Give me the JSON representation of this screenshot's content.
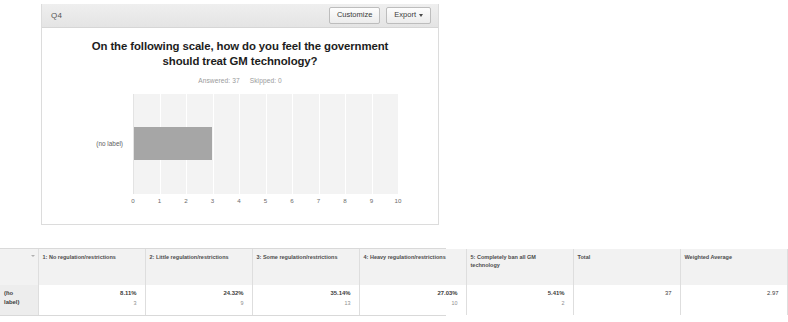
{
  "card": {
    "question_id": "Q4",
    "customize_label": "Customize",
    "export_label": "Export",
    "title_line1": "On the following scale, how do you feel the",
    "title_line2": "government should treat GM technology?",
    "answered_label": "Answered: 37",
    "skipped_label": "Skipped: 0"
  },
  "chart_data": {
    "type": "bar",
    "orientation": "horizontal",
    "title": "On the following scale, how do you feel the government should treat GM technology?",
    "categories": [
      "(no label)"
    ],
    "values": [
      2.97
    ],
    "xlabel": "",
    "ylabel": "",
    "xlim": [
      0,
      10
    ],
    "xticks": [
      "0",
      "1",
      "2",
      "3",
      "4",
      "5",
      "6",
      "7",
      "8",
      "9",
      "10"
    ],
    "grid": true,
    "legend": "none",
    "bar_color": "#a6a6a6",
    "plot_background": "#f3f3f3"
  },
  "table": {
    "corner_header": "",
    "headers": [
      "1: No regulation/restrictions",
      "2: Little regulation/restrictions",
      "3: Some regulation/restrictions",
      "4: Heavy regulation/restrictions",
      "5: Completely ban all GM technology",
      "Total",
      "Weighted Average"
    ],
    "rows": [
      {
        "label": "(no label)",
        "cells": [
          {
            "percent": "8.11%",
            "count": "3"
          },
          {
            "percent": "24.32%",
            "count": "9"
          },
          {
            "percent": "35.14%",
            "count": "13"
          },
          {
            "percent": "27.03%",
            "count": "10"
          },
          {
            "percent": "5.41%",
            "count": "2"
          }
        ],
        "total": "37",
        "weighted_average": "2.97"
      }
    ]
  }
}
